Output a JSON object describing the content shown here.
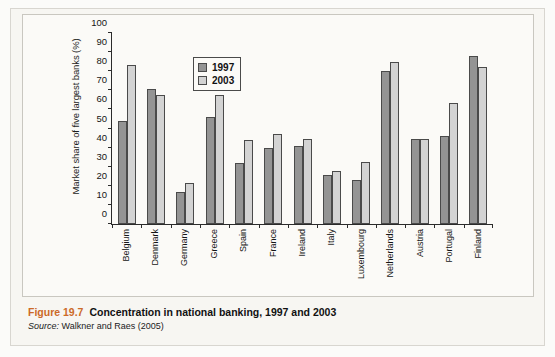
{
  "chart_data": {
    "type": "bar",
    "title": "Concentration in national banking, 1997 and 2003",
    "xlabel": "",
    "ylabel": "Market share of five largest banks (%)",
    "ylim": [
      0,
      100
    ],
    "yticks": [
      0,
      10,
      20,
      30,
      40,
      50,
      60,
      70,
      80,
      90,
      100
    ],
    "grid": false,
    "legend_position": "top-center",
    "categories": [
      "Belgium",
      "Denmark",
      "Germany",
      "Greece",
      "Spain",
      "France",
      "Ireland",
      "Italy",
      "Luxembourg",
      "Netherlands",
      "Austria",
      "Portugal",
      "Finland"
    ],
    "series": [
      {
        "name": "1997",
        "color": "#949494",
        "values": [
          54,
          70.5,
          17,
          56,
          32,
          40,
          41,
          25.5,
          23,
          80,
          44.5,
          46,
          88
        ]
      },
      {
        "name": "2003",
        "color": "#d3d3d3",
        "values": [
          83,
          67.5,
          21.5,
          67.5,
          44,
          47,
          44.5,
          27.5,
          32.5,
          85,
          44.5,
          63.5,
          82
        ]
      }
    ]
  },
  "caption": {
    "figure_number": "Figure 19.7",
    "title": "Concentration in national banking, 1997 and 2003",
    "source_word": "Source:",
    "source_text": "Walkner and Raes (2005)"
  },
  "colors": {
    "series_1997": "#949494",
    "series_2003": "#d3d3d3",
    "figure_number": "#cc6a28",
    "axis": "#2b2b2b",
    "paper": "#f7f6f2"
  }
}
